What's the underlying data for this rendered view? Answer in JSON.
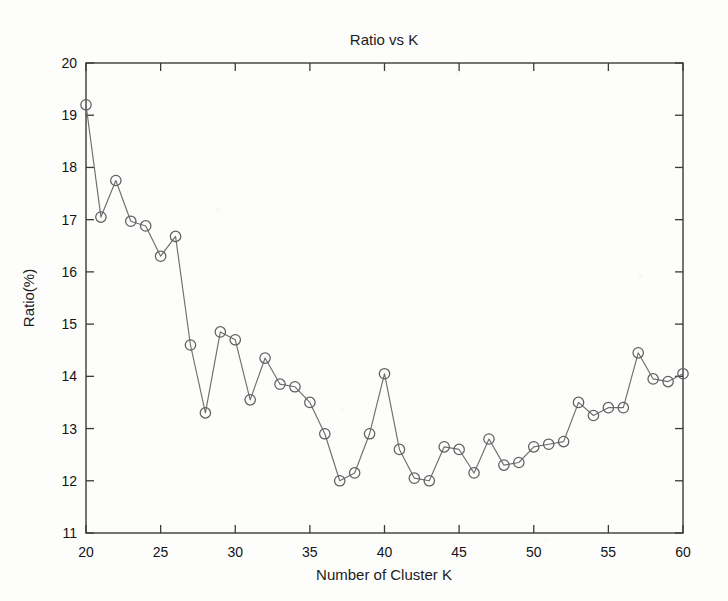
{
  "chart_data": {
    "type": "line",
    "title": "Ratio vs K",
    "xlabel": "Number of Cluster K",
    "ylabel": "Ratio(%)",
    "xlim": [
      20,
      60
    ],
    "ylim": [
      11,
      20
    ],
    "xticks": [
      20,
      25,
      30,
      35,
      40,
      45,
      50,
      55,
      60
    ],
    "xtick_labels": [
      "20",
      "25",
      "30",
      "35",
      "40",
      "45",
      "50",
      "55",
      "60"
    ],
    "yticks": [
      11,
      12,
      13,
      14,
      15,
      16,
      17,
      18,
      19,
      20
    ],
    "ytick_labels": [
      "11",
      "12",
      "13",
      "14",
      "15",
      "16",
      "17",
      "18",
      "19",
      "20"
    ],
    "grid": false,
    "legend": false,
    "marker": "circle-open",
    "line_color": "#6e6e6e",
    "marker_color": "#5f5f5f",
    "x": [
      20,
      21,
      22,
      23,
      24,
      25,
      26,
      27,
      28,
      29,
      30,
      31,
      32,
      33,
      34,
      35,
      36,
      37,
      38,
      39,
      40,
      41,
      42,
      43,
      44,
      45,
      46,
      47,
      48,
      49,
      50,
      51,
      52,
      53,
      54,
      55,
      56,
      57,
      58,
      59,
      60
    ],
    "values": [
      19.2,
      17.05,
      17.75,
      16.97,
      16.88,
      16.3,
      16.68,
      14.6,
      13.3,
      14.85,
      14.7,
      13.55,
      14.35,
      13.85,
      13.8,
      13.5,
      12.9,
      12.0,
      12.15,
      12.9,
      14.05,
      12.6,
      12.05,
      12.0,
      12.65,
      12.6,
      12.15,
      12.8,
      12.3,
      12.35,
      12.65,
      12.7,
      12.75,
      13.5,
      13.25,
      13.4,
      13.4,
      14.45,
      13.95,
      13.9,
      14.05
    ]
  }
}
